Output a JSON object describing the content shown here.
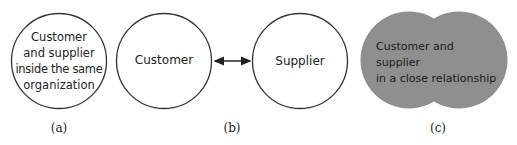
{
  "diagram": {
    "panels": [
      {
        "id": "a",
        "caption": "(a)",
        "text_lines": [
          "Customer",
          "and supplier",
          "inside the same",
          "organization"
        ]
      },
      {
        "id": "b",
        "caption": "(b)",
        "left_node": "Customer",
        "right_node": "Supplier",
        "connector": "bidirectional-arrow"
      },
      {
        "id": "c",
        "caption": "(c)",
        "text_lines": [
          "Customer and supplier",
          "in a close relationship"
        ]
      }
    ],
    "colors": {
      "stroke": "#333333",
      "merged_fill": "#8f8f8f",
      "text": "#222222"
    }
  }
}
